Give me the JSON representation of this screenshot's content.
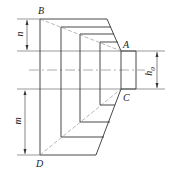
{
  "diagram": {
    "type": "stepped-frustum-cross-section",
    "points": {
      "A": "A",
      "B": "B",
      "C": "C",
      "D": "D"
    },
    "dimensions": {
      "top": "n",
      "bottom": "m",
      "right": "h0"
    },
    "right_label_main": "h",
    "right_label_sub": "0",
    "colors": {
      "line": "#333333",
      "dashed": "#888888"
    }
  }
}
